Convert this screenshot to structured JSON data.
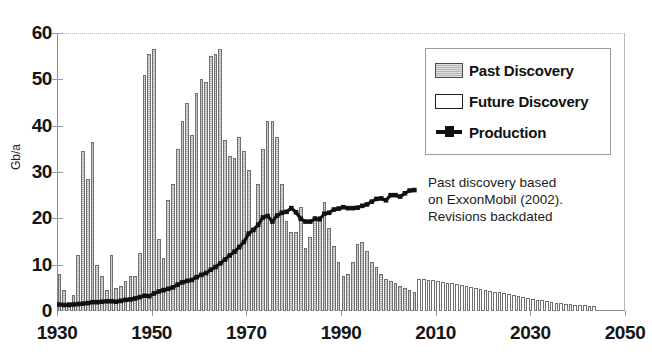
{
  "chart_data": {
    "type": "bar",
    "title": "",
    "subtitle": "",
    "xlabel": "",
    "ylabel": "Gb/a",
    "xlim": [
      1930,
      2050
    ],
    "ylim": [
      0,
      60
    ],
    "y_ticks": [
      0,
      10,
      20,
      30,
      40,
      50,
      60
    ],
    "x_ticks": [
      1930,
      1950,
      1970,
      1990,
      2010,
      2030,
      2050
    ],
    "grid": "top-dotted-only",
    "legend_position": "upper-right-inside",
    "annotation": [
      "Past discovery based",
      "on ExxonMobil (2002).",
      "Revisions backdated"
    ],
    "legend": [
      {
        "label": "Past Discovery",
        "swatch": "gray-filled-bar"
      },
      {
        "label": "Future Discovery",
        "swatch": "white-outlined-bar"
      },
      {
        "label": "Production",
        "swatch": "black-line-with-square-marker"
      }
    ],
    "series": [
      {
        "name": "Past Discovery",
        "type": "bar",
        "color": "#b6b6b6",
        "x": [
          1930,
          1931,
          1932,
          1933,
          1934,
          1935,
          1936,
          1937,
          1938,
          1939,
          1940,
          1941,
          1942,
          1943,
          1944,
          1945,
          1946,
          1947,
          1948,
          1949,
          1950,
          1951,
          1952,
          1953,
          1954,
          1955,
          1956,
          1957,
          1958,
          1959,
          1960,
          1961,
          1962,
          1963,
          1964,
          1965,
          1966,
          1967,
          1968,
          1969,
          1970,
          1971,
          1972,
          1973,
          1974,
          1975,
          1976,
          1977,
          1978,
          1979,
          1980,
          1981,
          1982,
          1983,
          1984,
          1985,
          1986,
          1987,
          1988,
          1989,
          1990,
          1991,
          1992,
          1993,
          1994,
          1995,
          1996,
          1997,
          1998,
          1999,
          2000,
          2001,
          2002,
          2003,
          2004,
          2005
        ],
        "values": [
          8.0,
          4.5,
          2.0,
          3.5,
          12.0,
          34.5,
          28.5,
          36.5,
          10.0,
          7.5,
          4.5,
          12.0,
          5.0,
          5.5,
          6.5,
          7.5,
          7.5,
          12.5,
          51.0,
          55.5,
          56.5,
          15.5,
          11.5,
          24.0,
          27.5,
          35.0,
          41.0,
          45.0,
          38.0,
          47.0,
          50.0,
          49.5,
          55.0,
          55.5,
          56.5,
          37.0,
          33.5,
          33.0,
          37.5,
          34.5,
          30.5,
          17.5,
          27.5,
          35.0,
          41.0,
          41.0,
          37.5,
          27.5,
          19.5,
          17.0,
          17.0,
          22.5,
          13.5,
          16.0,
          20.5,
          20.5,
          23.5,
          18.0,
          14.0,
          10.5,
          7.5,
          8.0,
          10.5,
          14.5,
          15.0,
          13.0,
          10.5,
          9.5,
          8.0,
          7.0,
          6.5,
          6.0,
          5.5,
          5.0,
          4.5,
          4.0
        ]
      },
      {
        "name": "Future Discovery",
        "type": "bar",
        "color": "#ffffff",
        "x": [
          2006,
          2007,
          2008,
          2009,
          2010,
          2011,
          2012,
          2013,
          2014,
          2015,
          2016,
          2017,
          2018,
          2019,
          2020,
          2021,
          2022,
          2023,
          2024,
          2025,
          2026,
          2027,
          2028,
          2029,
          2030,
          2031,
          2032,
          2033,
          2034,
          2035,
          2036,
          2037,
          2038,
          2039,
          2040,
          2041,
          2042,
          2043
        ],
        "values": [
          7.0,
          6.9,
          6.8,
          6.6,
          6.5,
          6.3,
          6.1,
          6.0,
          5.8,
          5.6,
          5.4,
          5.2,
          5.0,
          4.8,
          4.6,
          4.4,
          4.2,
          4.0,
          3.8,
          3.6,
          3.4,
          3.2,
          3.0,
          2.8,
          2.6,
          2.4,
          2.3,
          2.1,
          2.0,
          1.8,
          1.7,
          1.6,
          1.5,
          1.4,
          1.3,
          1.2,
          1.1,
          1.0
        ]
      },
      {
        "name": "Production",
        "type": "line",
        "color": "#111111",
        "x": [
          1930,
          1931,
          1932,
          1933,
          1934,
          1935,
          1936,
          1937,
          1938,
          1939,
          1940,
          1941,
          1942,
          1943,
          1944,
          1945,
          1946,
          1947,
          1948,
          1949,
          1950,
          1951,
          1952,
          1953,
          1954,
          1955,
          1956,
          1957,
          1958,
          1959,
          1960,
          1961,
          1962,
          1963,
          1964,
          1965,
          1966,
          1967,
          1968,
          1969,
          1970,
          1971,
          1972,
          1973,
          1974,
          1975,
          1976,
          1977,
          1978,
          1979,
          1980,
          1981,
          1982,
          1983,
          1984,
          1985,
          1986,
          1987,
          1988,
          1989,
          1990,
          1991,
          1992,
          1993,
          1994,
          1995,
          1996,
          1997,
          1998,
          1999,
          2000,
          2001,
          2002,
          2003,
          2004,
          2005
        ],
        "values": [
          1.4,
          1.3,
          1.3,
          1.4,
          1.5,
          1.6,
          1.7,
          1.9,
          1.9,
          2.0,
          2.1,
          2.1,
          2.0,
          2.2,
          2.4,
          2.5,
          2.7,
          3.0,
          3.3,
          3.2,
          3.8,
          4.2,
          4.5,
          4.8,
          5.1,
          5.7,
          6.2,
          6.5,
          6.7,
          7.3,
          7.8,
          8.2,
          8.9,
          9.5,
          10.3,
          11.1,
          12.0,
          12.8,
          13.8,
          14.9,
          16.7,
          17.5,
          18.6,
          20.2,
          20.5,
          19.3,
          20.6,
          21.2,
          21.4,
          22.2,
          21.3,
          19.9,
          19.3,
          19.3,
          19.9,
          19.8,
          21.0,
          21.2,
          21.9,
          22.1,
          22.4,
          22.2,
          22.2,
          22.3,
          22.7,
          23.0,
          23.6,
          24.2,
          24.3,
          23.9,
          25.0,
          25.0,
          24.7,
          25.4,
          26.0,
          26.1
        ]
      }
    ]
  },
  "axes": {
    "y_title": "Gb/a",
    "y_labels": [
      "60",
      "50",
      "40",
      "30",
      "20",
      "10",
      "0"
    ],
    "x_labels": [
      "1930",
      "1950",
      "1970",
      "1990",
      "2010",
      "2030",
      "2050"
    ]
  },
  "legend": {
    "items": [
      {
        "label": "Past Discovery"
      },
      {
        "label": "Future Discovery"
      },
      {
        "label": "Production"
      }
    ]
  },
  "annotation": {
    "line1": "Past discovery based",
    "line2": "on ExxonMobil (2002).",
    "line3": "Revisions backdated"
  }
}
